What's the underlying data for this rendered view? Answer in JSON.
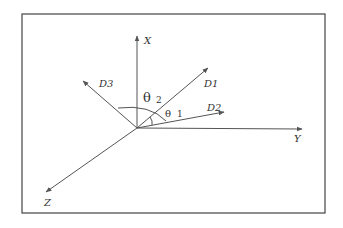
{
  "diagram": {
    "type": "3d-coordinate-axes",
    "origin": [
      137,
      128
    ],
    "axes": [
      {
        "id": "X",
        "label": "X",
        "tip": [
          137,
          36
        ],
        "label_pos": [
          144,
          44
        ]
      },
      {
        "id": "Y",
        "label": "Y",
        "tip": [
          302,
          129
        ],
        "label_pos": [
          294,
          142
        ]
      },
      {
        "id": "Z",
        "label": "Z",
        "tip": [
          46,
          192
        ],
        "label_pos": [
          44,
          206
        ]
      }
    ],
    "directions": [
      {
        "id": "D1",
        "label": "D1",
        "tip": [
          208,
          68
        ],
        "label_pos": [
          204,
          87
        ]
      },
      {
        "id": "D2",
        "label": "D2",
        "tip": [
          224,
          112
        ],
        "label_pos": [
          207,
          111
        ]
      },
      {
        "id": "D3",
        "label": "D3",
        "tip": [
          83,
          81
        ],
        "label_pos": [
          99,
          87
        ]
      }
    ],
    "angles": [
      {
        "id": "theta2",
        "symbol": "θ",
        "subscript": "2",
        "symbol_pos": [
          143,
          102
        ],
        "sub_pos": [
          156,
          103
        ]
      },
      {
        "id": "theta1",
        "symbol": "θ",
        "subscript": "1",
        "symbol_pos": [
          165,
          117
        ],
        "sub_pos": [
          177,
          117
        ]
      }
    ],
    "colors": {
      "stroke": "#555555",
      "frame": "#444444",
      "text": "#333333",
      "background": "#ffffff"
    }
  }
}
